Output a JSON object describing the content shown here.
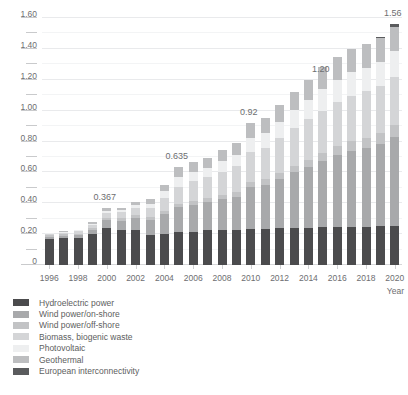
{
  "chart_data": {
    "type": "bar",
    "stacked": true,
    "title": "",
    "xlabel": "Year",
    "ylabel": "",
    "ylim": [
      0,
      1.6
    ],
    "yticks": [
      "0",
      "0.20",
      "0.40",
      "0.60",
      "0.80",
      "1.00",
      "1.20",
      "1.40",
      "1.60"
    ],
    "ytick_values": [
      0,
      0.2,
      0.4,
      0.6,
      0.8,
      1.0,
      1.2,
      1.4,
      1.6
    ],
    "minor_ticks": [
      0.1,
      0.3,
      0.5,
      0.7,
      0.9,
      1.1,
      1.3,
      1.5
    ],
    "grid": true,
    "legend_position": "below-left",
    "categories": [
      "1996",
      "1997",
      "1998",
      "1999",
      "2000",
      "2001",
      "2002",
      "2003",
      "2004",
      "2005",
      "2006",
      "2007",
      "2008",
      "2009",
      "2010",
      "2011",
      "2012",
      "2013",
      "2014",
      "2015",
      "2016",
      "2017",
      "2018",
      "2019",
      "2020"
    ],
    "xtick_labels": [
      "1996",
      "1998",
      "2000",
      "2002",
      "2004",
      "2006",
      "2008",
      "2010",
      "2012",
      "2014",
      "2016",
      "2018",
      "2020"
    ],
    "series": [
      {
        "name": "Hydroelectric power",
        "color": "#4b4b4d",
        "values": [
          0.168,
          0.172,
          0.175,
          0.202,
          0.237,
          0.228,
          0.226,
          0.196,
          0.203,
          0.212,
          0.216,
          0.225,
          0.225,
          0.227,
          0.235,
          0.235,
          0.238,
          0.24,
          0.242,
          0.248,
          0.248,
          0.249,
          0.249,
          0.25,
          0.25
        ]
      },
      {
        "name": "Wind power/on-shore",
        "color": "#a8a9ab",
        "values": [
          0.032,
          0.036,
          0.04,
          0.055,
          0.092,
          0.11,
          0.14,
          0.17,
          0.23,
          0.275,
          0.3,
          0.33,
          0.35,
          0.375,
          0.39,
          0.42,
          0.45,
          0.5,
          0.53,
          0.57,
          0.64,
          0.7,
          0.74,
          0.81,
          0.9
        ]
      },
      {
        "name": "Wind power/off-shore",
        "color": "#c2c3c5"
      },
      {
        "name": "Biomass, biogenic waste",
        "color": "#d4d5d7",
        "values": [
          0.01,
          0.012,
          0.015,
          0.02,
          0.03,
          0.035,
          0.045,
          0.06,
          0.085,
          0.105,
          0.12,
          0.14,
          0.155,
          0.17,
          0.18,
          0.19,
          0.2,
          0.21,
          0.215,
          0.22,
          0.225,
          0.228,
          0.23,
          0.232,
          0.235
        ]
      },
      {
        "name": "Photovoltaic",
        "color": "#eeeff0"
      },
      {
        "name": "Geothermal",
        "color": "#bdbec0"
      },
      {
        "name": "European interconnectivity",
        "color": "#5a5b5d"
      }
    ],
    "totals": [
      0.21,
      0.22,
      0.23,
      0.277,
      0.367,
      0.367,
      0.411,
      0.426,
      0.518,
      0.635,
      0.67,
      0.695,
      0.742,
      0.79,
      0.92,
      0.955,
      1.035,
      1.12,
      1.2,
      1.28,
      1.345,
      1.4,
      1.435,
      1.48,
      1.56
    ],
    "data_labels": [
      {
        "category": "2000",
        "value": 0.367,
        "text": "0.367"
      },
      {
        "category": "2005",
        "value": 0.635,
        "text": "0.635"
      },
      {
        "category": "2010",
        "value": 0.92,
        "text": "0.92"
      },
      {
        "category": "2015",
        "value": 1.2,
        "text": "1.20"
      },
      {
        "category": "2020",
        "value": 1.56,
        "text": "1.56"
      }
    ],
    "bar_segments": [
      [
        0.168,
        0.014,
        0.01,
        0.01,
        0.004,
        0.004,
        0.0
      ],
      [
        0.172,
        0.016,
        0.01,
        0.012,
        0.005,
        0.005,
        0.0
      ],
      [
        0.175,
        0.018,
        0.011,
        0.014,
        0.006,
        0.006,
        0.0
      ],
      [
        0.202,
        0.026,
        0.013,
        0.02,
        0.008,
        0.008,
        0.0
      ],
      [
        0.237,
        0.052,
        0.016,
        0.034,
        0.014,
        0.014,
        0.0
      ],
      [
        0.228,
        0.059,
        0.017,
        0.038,
        0.012,
        0.013,
        0.0
      ],
      [
        0.226,
        0.079,
        0.019,
        0.047,
        0.02,
        0.02,
        0.0
      ],
      [
        0.196,
        0.093,
        0.02,
        0.06,
        0.028,
        0.029,
        0.0
      ],
      [
        0.203,
        0.127,
        0.022,
        0.085,
        0.04,
        0.041,
        0.0
      ],
      [
        0.212,
        0.162,
        0.024,
        0.11,
        0.062,
        0.065,
        0.0
      ],
      [
        0.216,
        0.175,
        0.026,
        0.125,
        0.062,
        0.066,
        0.0
      ],
      [
        0.225,
        0.18,
        0.028,
        0.135,
        0.062,
        0.065,
        0.0
      ],
      [
        0.225,
        0.2,
        0.03,
        0.15,
        0.068,
        0.069,
        0.0
      ],
      [
        0.227,
        0.215,
        0.032,
        0.165,
        0.075,
        0.076,
        0.0
      ],
      [
        0.235,
        0.27,
        0.034,
        0.195,
        0.092,
        0.094,
        0.0
      ],
      [
        0.235,
        0.285,
        0.036,
        0.205,
        0.096,
        0.098,
        0.0
      ],
      [
        0.238,
        0.32,
        0.038,
        0.225,
        0.105,
        0.109,
        0.0
      ],
      [
        0.24,
        0.36,
        0.042,
        0.245,
        0.115,
        0.118,
        0.0
      ],
      [
        0.242,
        0.395,
        0.046,
        0.26,
        0.128,
        0.129,
        0.0
      ],
      [
        0.248,
        0.425,
        0.052,
        0.275,
        0.139,
        0.141,
        0.0
      ],
      [
        0.248,
        0.465,
        0.058,
        0.288,
        0.142,
        0.144,
        0.0
      ],
      [
        0.249,
        0.492,
        0.062,
        0.295,
        0.15,
        0.152,
        0.0
      ],
      [
        0.249,
        0.51,
        0.066,
        0.3,
        0.154,
        0.156,
        0.0
      ],
      [
        0.25,
        0.535,
        0.07,
        0.305,
        0.158,
        0.15,
        0.012
      ],
      [
        0.25,
        0.58,
        0.076,
        0.312,
        0.166,
        0.158,
        0.018
      ]
    ]
  },
  "legend": {
    "items": [
      {
        "label": "Hydroelectric power",
        "color": "#4b4b4d"
      },
      {
        "label": "Wind power/on-shore",
        "color": "#a8a9ab"
      },
      {
        "label": "Wind power/off-shore",
        "color": "#c2c3c5"
      },
      {
        "label": "Biomass, biogenic waste",
        "color": "#d4d5d7"
      },
      {
        "label": "Photovoltaic",
        "color": "#eeeff0"
      },
      {
        "label": "Geothermal",
        "color": "#bdbec0"
      },
      {
        "label": "European interconnectivity",
        "color": "#5a5b5d"
      }
    ]
  },
  "axis": {
    "x_title": "Year"
  }
}
